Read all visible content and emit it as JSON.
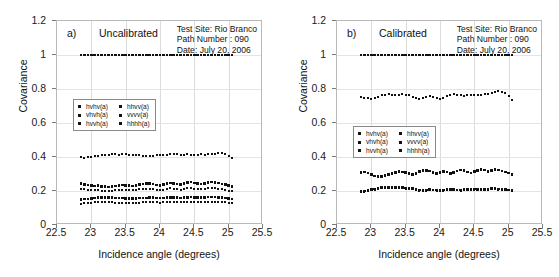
{
  "figure": {
    "axis_titles": {
      "x": "Incidence angle (degrees)",
      "y": "Covariance"
    },
    "xticks": [
      "22.5",
      "23",
      "23.5",
      "24",
      "24.5",
      "25",
      "25.5"
    ],
    "yticks": [
      "0",
      "0.2",
      "0.4",
      "0.6",
      "0.8",
      "1",
      "1.2"
    ],
    "annotation": {
      "test_site": "Test Site: Rio Branco",
      "path_number": "Path Number : 090",
      "date": "Date: July 20, 2006"
    },
    "legend_entries": {
      "left": [
        "hvhv(a)",
        "vhvh(a)",
        "hvvh(a)"
      ],
      "right": [
        "hhvv(a)",
        "vvvv(a)",
        "hhhh(a)"
      ]
    }
  },
  "panels": [
    {
      "tag": "a)",
      "state": "Uncalibrated"
    },
    {
      "tag": "b)",
      "state": "Calibrated"
    }
  ],
  "chart_data": [
    {
      "type": "scatter",
      "title": "a) Uncalibrated",
      "xlabel": "Incidence angle (degrees)",
      "ylabel": "Covariance",
      "xlim": [
        22.5,
        25.5
      ],
      "ylim": [
        0,
        1.2
      ],
      "xticks": [
        22.5,
        23,
        23.5,
        24,
        24.5,
        25,
        25.5
      ],
      "yticks": [
        0,
        0.2,
        0.4,
        0.6,
        0.8,
        1,
        1.2
      ],
      "grid": true,
      "legend_position": "center-left",
      "x": [
        22.85,
        22.9,
        22.95,
        23.0,
        23.05,
        23.1,
        23.15,
        23.2,
        23.25,
        23.3,
        23.35,
        23.4,
        23.45,
        23.5,
        23.55,
        23.6,
        23.65,
        23.7,
        23.75,
        23.8,
        23.85,
        23.9,
        23.95,
        24.0,
        24.05,
        24.1,
        24.15,
        24.2,
        24.25,
        24.3,
        24.35,
        24.4,
        24.45,
        24.5,
        24.55,
        24.6,
        24.65,
        24.7,
        24.75,
        24.8,
        24.85,
        24.9,
        24.95,
        25.0,
        25.05
      ],
      "series": [
        {
          "name": "hhhh(a)",
          "values": [
            1.0,
            1.0,
            1.0,
            1.0,
            1.0,
            1.0,
            1.0,
            1.0,
            1.0,
            1.0,
            1.0,
            1.0,
            1.0,
            1.0,
            1.0,
            1.0,
            1.0,
            1.0,
            1.0,
            1.0,
            1.0,
            1.0,
            1.0,
            1.0,
            1.0,
            1.0,
            1.0,
            1.0,
            1.0,
            1.0,
            1.0,
            1.0,
            1.0,
            1.0,
            1.0,
            1.0,
            1.0,
            1.0,
            1.0,
            1.0,
            1.0,
            1.0,
            1.0,
            1.0,
            1.0
          ]
        },
        {
          "name": "vvvv(a)",
          "values": [
            0.398,
            0.396,
            0.399,
            0.401,
            0.403,
            0.408,
            0.412,
            0.414,
            0.413,
            0.415,
            0.416,
            0.414,
            0.417,
            0.415,
            0.412,
            0.411,
            0.413,
            0.409,
            0.406,
            0.404,
            0.405,
            0.408,
            0.41,
            0.412,
            0.414,
            0.413,
            0.415,
            0.417,
            0.416,
            0.414,
            0.413,
            0.415,
            0.414,
            0.412,
            0.413,
            0.415,
            0.414,
            0.416,
            0.418,
            0.42,
            0.422,
            0.421,
            0.417,
            0.408,
            0.396
          ]
        },
        {
          "name": "hvhv(a)",
          "values": [
            0.243,
            0.238,
            0.236,
            0.232,
            0.229,
            0.231,
            0.228,
            0.226,
            0.224,
            0.227,
            0.23,
            0.233,
            0.236,
            0.234,
            0.231,
            0.229,
            0.233,
            0.238,
            0.242,
            0.245,
            0.243,
            0.24,
            0.236,
            0.233,
            0.238,
            0.244,
            0.248,
            0.245,
            0.241,
            0.238,
            0.243,
            0.249,
            0.252,
            0.248,
            0.244,
            0.241,
            0.245,
            0.25,
            0.253,
            0.25,
            0.246,
            0.242,
            0.238,
            0.232,
            0.226
          ]
        },
        {
          "name": "vhvh(a)",
          "values": [
            0.212,
            0.209,
            0.207,
            0.205,
            0.203,
            0.204,
            0.202,
            0.201,
            0.2,
            0.202,
            0.204,
            0.206,
            0.208,
            0.207,
            0.205,
            0.203,
            0.206,
            0.209,
            0.212,
            0.214,
            0.213,
            0.21,
            0.207,
            0.205,
            0.208,
            0.212,
            0.215,
            0.213,
            0.21,
            0.208,
            0.211,
            0.215,
            0.217,
            0.214,
            0.211,
            0.209,
            0.212,
            0.216,
            0.218,
            0.215,
            0.212,
            0.209,
            0.206,
            0.202,
            0.198
          ]
        },
        {
          "name": "hhvv(a)",
          "values": [
            0.15,
            0.152,
            0.154,
            0.157,
            0.16,
            0.162,
            0.163,
            0.163,
            0.162,
            0.161,
            0.16,
            0.159,
            0.158,
            0.157,
            0.156,
            0.156,
            0.157,
            0.158,
            0.159,
            0.16,
            0.161,
            0.161,
            0.16,
            0.159,
            0.16,
            0.162,
            0.163,
            0.162,
            0.161,
            0.16,
            0.161,
            0.163,
            0.164,
            0.163,
            0.162,
            0.161,
            0.162,
            0.164,
            0.165,
            0.164,
            0.163,
            0.162,
            0.16,
            0.157,
            0.154
          ]
        },
        {
          "name": "hvvh(a)",
          "values": [
            0.126,
            0.127,
            0.129,
            0.131,
            0.133,
            0.134,
            0.135,
            0.135,
            0.134,
            0.133,
            0.132,
            0.132,
            0.131,
            0.131,
            0.13,
            0.13,
            0.131,
            0.132,
            0.133,
            0.134,
            0.134,
            0.134,
            0.133,
            0.132,
            0.133,
            0.135,
            0.136,
            0.135,
            0.134,
            0.133,
            0.134,
            0.136,
            0.137,
            0.136,
            0.135,
            0.134,
            0.135,
            0.137,
            0.138,
            0.137,
            0.136,
            0.135,
            0.133,
            0.13,
            0.128
          ]
        }
      ]
    },
    {
      "type": "scatter",
      "title": "b) Calibrated",
      "xlabel": "Incidence angle (degrees)",
      "ylabel": "Covariance",
      "xlim": [
        22.5,
        25.5
      ],
      "ylim": [
        0,
        1.2
      ],
      "xticks": [
        22.5,
        23,
        23.5,
        24,
        24.5,
        25,
        25.5
      ],
      "yticks": [
        0,
        0.2,
        0.4,
        0.6,
        0.8,
        1,
        1.2
      ],
      "grid": true,
      "legend_position": "center-left",
      "x": [
        22.85,
        22.9,
        22.95,
        23.0,
        23.05,
        23.1,
        23.15,
        23.2,
        23.25,
        23.3,
        23.35,
        23.4,
        23.45,
        23.5,
        23.55,
        23.6,
        23.65,
        23.7,
        23.75,
        23.8,
        23.85,
        23.9,
        23.95,
        24.0,
        24.05,
        24.1,
        24.15,
        24.2,
        24.25,
        24.3,
        24.35,
        24.4,
        24.45,
        24.5,
        24.55,
        24.6,
        24.65,
        24.7,
        24.75,
        24.8,
        24.85,
        24.9,
        24.95,
        25.0,
        25.05
      ],
      "series": [
        {
          "name": "hhhh(a)",
          "values": [
            1.0,
            1.0,
            1.0,
            1.0,
            1.0,
            1.0,
            1.0,
            1.0,
            1.0,
            1.0,
            1.0,
            1.0,
            1.0,
            1.0,
            1.0,
            1.0,
            1.0,
            1.0,
            1.0,
            1.0,
            1.0,
            1.0,
            1.0,
            1.0,
            1.0,
            1.0,
            1.0,
            1.0,
            1.0,
            1.0,
            1.0,
            1.0,
            1.0,
            1.0,
            1.0,
            1.0,
            1.0,
            1.0,
            1.0,
            1.0,
            1.0,
            1.0,
            1.0,
            1.0,
            1.0
          ]
        },
        {
          "name": "vvvv(a)",
          "values": [
            0.752,
            0.748,
            0.746,
            0.744,
            0.747,
            0.755,
            0.762,
            0.766,
            0.768,
            0.765,
            0.763,
            0.766,
            0.769,
            0.767,
            0.762,
            0.755,
            0.748,
            0.744,
            0.746,
            0.752,
            0.758,
            0.752,
            0.746,
            0.744,
            0.748,
            0.756,
            0.764,
            0.768,
            0.766,
            0.762,
            0.76,
            0.763,
            0.766,
            0.764,
            0.762,
            0.765,
            0.768,
            0.772,
            0.778,
            0.784,
            0.788,
            0.784,
            0.774,
            0.76,
            0.738
          ]
        },
        {
          "name": "hhvv(a)",
          "values": [
            0.308,
            0.312,
            0.305,
            0.296,
            0.288,
            0.284,
            0.287,
            0.292,
            0.298,
            0.304,
            0.31,
            0.314,
            0.312,
            0.308,
            0.302,
            0.296,
            0.304,
            0.314,
            0.32,
            0.322,
            0.318,
            0.31,
            0.302,
            0.308,
            0.316,
            0.312,
            0.304,
            0.31,
            0.318,
            0.324,
            0.32,
            0.312,
            0.306,
            0.314,
            0.322,
            0.328,
            0.324,
            0.316,
            0.322,
            0.328,
            0.324,
            0.318,
            0.312,
            0.306,
            0.298
          ]
        },
        {
          "name": "hvhv(a)",
          "values": [
            0.196,
            0.199,
            0.203,
            0.208,
            0.212,
            0.216,
            0.219,
            0.221,
            0.222,
            0.222,
            0.221,
            0.22,
            0.219,
            0.218,
            0.216,
            0.213,
            0.208,
            0.205,
            0.204,
            0.206,
            0.208,
            0.207,
            0.205,
            0.204,
            0.206,
            0.208,
            0.21,
            0.209,
            0.207,
            0.206,
            0.208,
            0.21,
            0.212,
            0.211,
            0.209,
            0.208,
            0.21,
            0.212,
            0.214,
            0.213,
            0.211,
            0.21,
            0.209,
            0.207,
            0.205
          ]
        },
        {
          "name": "vhvh(a)",
          "values": [
            0.192,
            0.195,
            0.199,
            0.204,
            0.208,
            0.212,
            0.215,
            0.217,
            0.218,
            0.218,
            0.217,
            0.216,
            0.215,
            0.214,
            0.212,
            0.209,
            0.204,
            0.201,
            0.2,
            0.202,
            0.204,
            0.203,
            0.201,
            0.2,
            0.202,
            0.204,
            0.206,
            0.205,
            0.203,
            0.202,
            0.204,
            0.206,
            0.208,
            0.207,
            0.205,
            0.204,
            0.206,
            0.208,
            0.21,
            0.209,
            0.207,
            0.206,
            0.205,
            0.203,
            0.201
          ]
        }
      ]
    }
  ]
}
